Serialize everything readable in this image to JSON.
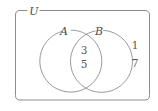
{
  "figure": {
    "kind": "venn-diagram",
    "background_color": "#ffffff",
    "stroke_color": "#8d8d8d",
    "text_color": "#4a4a4a"
  },
  "universe": {
    "label": "U"
  },
  "sets": {
    "left": {
      "label": "A"
    },
    "right": {
      "label": "B"
    }
  },
  "regions": {
    "intersection": {
      "name": "A-and-B",
      "elements": [
        "3",
        "5"
      ]
    },
    "outside_both": {
      "name": "outside-A-and-B",
      "elements": [
        "1",
        "7"
      ]
    },
    "left_only": {
      "name": "A-only",
      "elements": []
    },
    "right_only": {
      "name": "B-only",
      "elements": []
    }
  }
}
